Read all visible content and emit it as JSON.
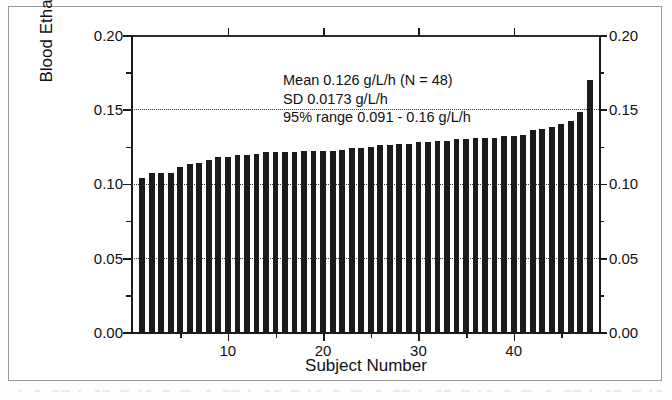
{
  "figure": {
    "annotation_lines": [
      "Mean 0.126 g/L/h (N = 48)",
      "SD 0.0173 g/L/h",
      "95% range 0.091 - 0.16 g/L/h"
    ]
  },
  "chart_data": {
    "type": "bar",
    "title": "",
    "xlabel": "Subject Number",
    "ylabel": "Blood Ethanol elimination, g/L/h",
    "ylabel_right": "Blood Ethanol elimination, g/L/h",
    "xlim": [
      0,
      49
    ],
    "ylim": [
      0.0,
      0.2
    ],
    "grid": true,
    "grid_style": "dotted",
    "grid_values": [
      0.05,
      0.1,
      0.15
    ],
    "legend": null,
    "y_ticks_major": [
      0.0,
      0.05,
      0.1,
      0.15,
      0.2
    ],
    "y_tick_labels": [
      "0.00",
      "0.05",
      "0.10",
      "0.15",
      "0.20"
    ],
    "y_ticks_minor": [
      0.025,
      0.075,
      0.125,
      0.175
    ],
    "x_ticks_major": [
      10,
      20,
      30,
      40
    ],
    "x_tick_labels": [
      "10",
      "20",
      "30",
      "40"
    ],
    "x_ticks_minor": [
      5,
      15,
      25,
      35,
      45
    ],
    "bar_color": "#1b1b1b",
    "categories": [
      1,
      2,
      3,
      4,
      5,
      6,
      7,
      8,
      9,
      10,
      11,
      12,
      13,
      14,
      15,
      16,
      17,
      18,
      19,
      20,
      21,
      22,
      23,
      24,
      25,
      26,
      27,
      28,
      29,
      30,
      31,
      32,
      33,
      34,
      35,
      36,
      37,
      38,
      39,
      40,
      41,
      42,
      43,
      44,
      45,
      46,
      47,
      48
    ],
    "values": [
      0.104,
      0.107,
      0.107,
      0.107,
      0.111,
      0.113,
      0.114,
      0.116,
      0.118,
      0.118,
      0.119,
      0.119,
      0.12,
      0.121,
      0.121,
      0.121,
      0.121,
      0.122,
      0.122,
      0.122,
      0.122,
      0.123,
      0.124,
      0.124,
      0.125,
      0.126,
      0.126,
      0.127,
      0.127,
      0.128,
      0.128,
      0.129,
      0.129,
      0.13,
      0.13,
      0.131,
      0.131,
      0.131,
      0.132,
      0.132,
      0.133,
      0.136,
      0.137,
      0.138,
      0.14,
      0.142,
      0.148,
      0.17
    ],
    "statistics": {
      "mean": 0.126,
      "n": 48,
      "sd": 0.0173,
      "range_95_low": 0.091,
      "range_95_high": 0.16,
      "units": "g/L/h"
    }
  }
}
